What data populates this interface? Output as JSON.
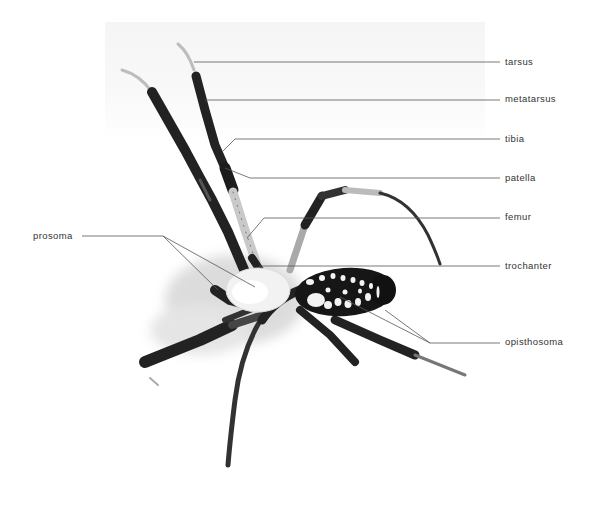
{
  "figure": {
    "colors": {
      "ink": "#1a1a1a",
      "leader": "#555555",
      "label_text": "#333333",
      "background": "#ffffff"
    }
  },
  "labels": {
    "right": [
      {
        "id": "tarsus",
        "text": "tarsus",
        "x": 505,
        "y": 56,
        "line": [
          [
            194,
            62
          ],
          [
            500,
            62
          ]
        ]
      },
      {
        "id": "metatarsus",
        "text": "metatarsus",
        "x": 505,
        "y": 93,
        "line": [
          [
            205,
            100
          ],
          [
            500,
            100
          ]
        ]
      },
      {
        "id": "tibia",
        "text": "tibia",
        "x": 505,
        "y": 133,
        "line": [
          [
            222,
            152
          ],
          [
            235,
            139
          ],
          [
            500,
            139
          ]
        ]
      },
      {
        "id": "patella",
        "text": "patella",
        "x": 505,
        "y": 172,
        "line": [
          [
            225,
            168
          ],
          [
            250,
            178
          ],
          [
            500,
            178
          ]
        ]
      },
      {
        "id": "femur",
        "text": "femur",
        "x": 505,
        "y": 211,
        "line": [
          [
            247,
            238
          ],
          [
            264,
            218
          ],
          [
            500,
            218
          ]
        ]
      },
      {
        "id": "trochanter",
        "text": "trochanter",
        "x": 505,
        "y": 260,
        "line": [
          [
            259,
            266
          ],
          [
            500,
            266
          ]
        ]
      },
      {
        "id": "opisthosoma",
        "text": "opisthosoma",
        "x": 505,
        "y": 336,
        "line": [
          [
            340,
            297
          ],
          [
            430,
            343
          ],
          [
            500,
            343
          ]
        ]
      }
    ],
    "left": [
      {
        "id": "prosoma",
        "text": "prosoma",
        "x": 33,
        "y": 230,
        "line": [
          [
            82,
            236
          ],
          [
            163,
            236
          ]
        ]
      }
    ]
  },
  "leader_branches": {
    "prosoma": [
      [
        [
          163,
          236
        ],
        [
          255,
          287
        ]
      ],
      [
        [
          163,
          236
        ],
        [
          218,
          290
        ]
      ]
    ],
    "opisthosoma": [
      [
        [
          430,
          343
        ],
        [
          385,
          310
        ]
      ]
    ]
  }
}
